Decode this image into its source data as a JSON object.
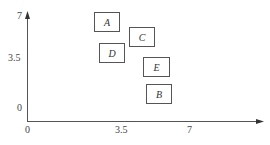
{
  "axes": {
    "y_ticks": [
      "7",
      "3.5",
      "0"
    ],
    "x_ticks": [
      "0",
      "3.5",
      "7"
    ]
  },
  "boxes": [
    {
      "label": "A",
      "left": 94,
      "top": 12,
      "width": 26,
      "height": 20
    },
    {
      "label": "C",
      "left": 129,
      "top": 27,
      "width": 26,
      "height": 20
    },
    {
      "label": "D",
      "left": 99,
      "top": 43,
      "width": 26,
      "height": 20
    },
    {
      "label": "E",
      "left": 143,
      "top": 57,
      "width": 27,
      "height": 20
    },
    {
      "label": "B",
      "left": 146,
      "top": 84,
      "width": 26,
      "height": 20
    }
  ]
}
